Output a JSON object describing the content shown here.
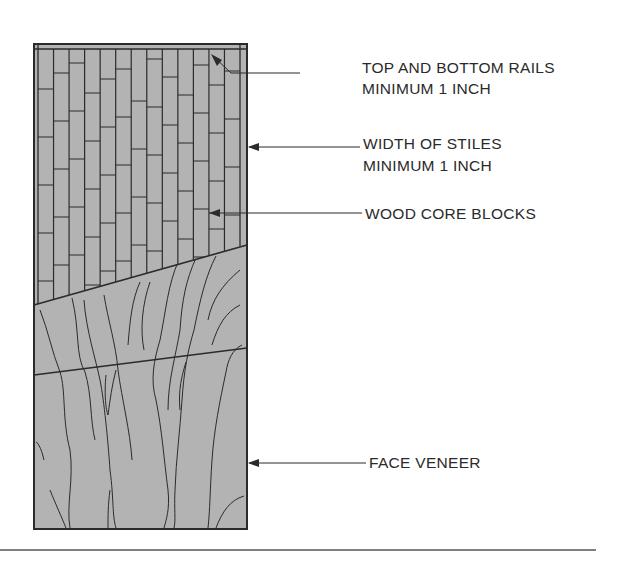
{
  "figure": {
    "colors": {
      "panel_fill": "#b3b3b3",
      "line": "#2b2b2b",
      "text": "#2a2a2a",
      "background": "#ffffff"
    }
  },
  "labels": {
    "rails_line1": "TOP AND BOTTOM RAILS",
    "rails_line2": "MINIMUM 1 INCH",
    "stiles_line1": "WIDTH OF STILES",
    "stiles_line2": "MINIMUM 1 INCH",
    "core_blocks": "WOOD CORE BLOCKS",
    "face_veneer": "FACE VENEER"
  }
}
